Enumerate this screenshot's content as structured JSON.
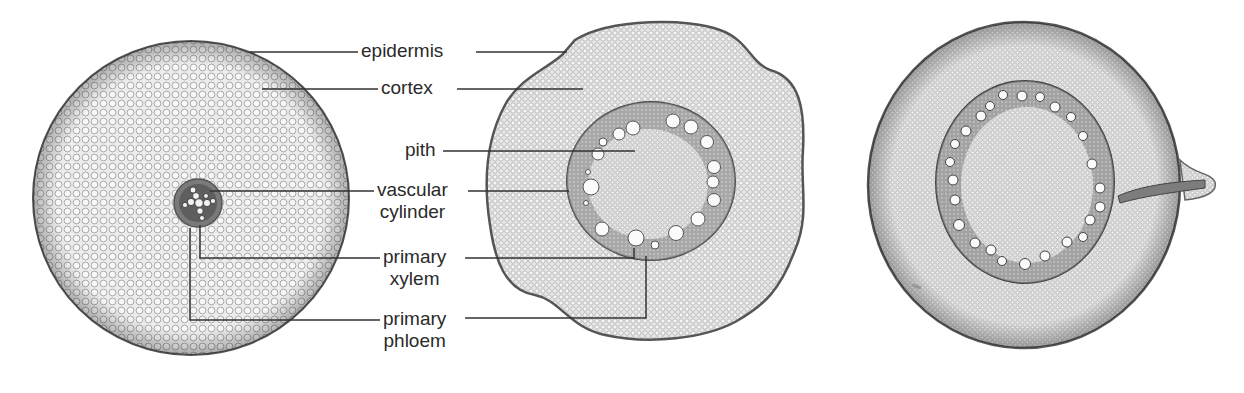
{
  "figure": {
    "panels": [
      {
        "name": "left-section",
        "type": "dicot root cross-section with small central vascular cylinder"
      },
      {
        "name": "middle-section",
        "type": "monocot root cross-section with ring of xylem vessels"
      },
      {
        "name": "right-section",
        "type": "monocot root cross-section with ring of xylem vessels and emerging lateral root"
      }
    ],
    "labels": {
      "epidermis": "epidermis",
      "cortex": "cortex",
      "pith": "pith",
      "vascular_line1": "vascular",
      "vascular_line2": "cylinder",
      "primary_xylem_line1": "primary",
      "primary_xylem_line2": "xylem",
      "primary_phloem_line1": "primary",
      "primary_phloem_line2": "phloem"
    },
    "colors": {
      "background": "#ffffff",
      "tissue_fill": "#e9e9e9",
      "tissue_texture": "#b5b5b5",
      "outline": "#555555",
      "vascular_dark": "#6a6a6a",
      "leader_line": "#333333",
      "text": "#2a2a2a"
    }
  }
}
